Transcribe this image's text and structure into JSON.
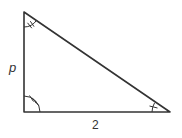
{
  "diagram": {
    "type": "right-triangle",
    "vertices": {
      "top": {
        "x": 24,
        "y": 12,
        "angle_ticks": 2
      },
      "right_angle_corner": {
        "x": 24,
        "y": 112,
        "angle_ticks": 3
      },
      "bottom_right": {
        "x": 170,
        "y": 112,
        "angle_ticks": 1
      }
    },
    "labels": {
      "vertical_side": "p",
      "bottom_side": "2"
    },
    "stroke_color": "#333333",
    "background_color": "#ffffff"
  }
}
